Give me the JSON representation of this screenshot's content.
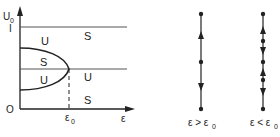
{
  "bifurcation_diagram": {
    "y_axis_label": "U",
    "y_axis_label_sub": "0",
    "y_tick_top": "I",
    "origin_label": "O",
    "x_axis_label": "ε",
    "x_critical_label": "ε",
    "x_critical_label_sub": "0",
    "region_labels": {
      "above_curve": "U",
      "top_right": "S",
      "inside_upper": "S",
      "inside_lower": "U",
      "middle_right": "U",
      "bottom_right": "S"
    }
  },
  "phase_lines": [
    {
      "caption": "ε > ε",
      "caption_sub": "0",
      "fixed_points": 3,
      "arrows": [
        "up",
        "down"
      ]
    },
    {
      "caption": "ε < ε",
      "caption_sub": "0",
      "fixed_points": 5,
      "arrows": [
        "up",
        "down",
        "up",
        "down"
      ]
    }
  ],
  "colors": {
    "line": "#222222",
    "axis": "#333333",
    "grid": "#555555"
  }
}
